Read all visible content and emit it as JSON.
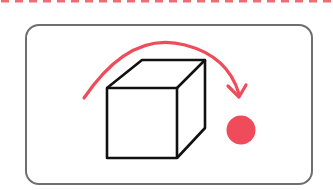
{
  "diagram": {
    "icons": [
      "dashed-divider",
      "frame",
      "cube-icon",
      "rotate-arrow-icon",
      "dot-icon"
    ],
    "colors": {
      "accent": "#ef4b5a",
      "outline": "#111111",
      "frame": "#6e6e6e",
      "background": "#ffffff"
    }
  }
}
